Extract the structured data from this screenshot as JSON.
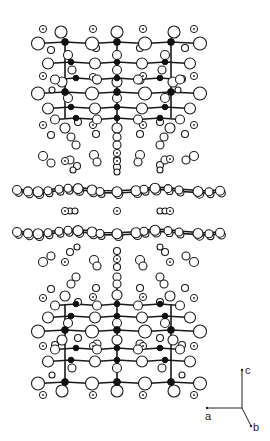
{
  "figure": {
    "colors": {
      "bond": "#1a1a1a",
      "metal": "#111111",
      "atom_fill": "#ffffff"
    }
  },
  "axes": {
    "labels": {
      "a": "a",
      "b": "b",
      "c": "c"
    },
    "origin": [
      242,
      408
    ],
    "a_end": [
      207,
      408
    ],
    "b_end": [
      251,
      426
    ],
    "c_end": [
      242,
      370
    ]
  },
  "upper_block": {
    "chains": [
      {
        "y": 42,
        "xs": [
          38,
          65,
          92,
          117,
          145,
          171,
          200
        ],
        "metal_idx": [
          1,
          3,
          5
        ],
        "r_open": 6.5
      },
      {
        "y": 62,
        "xs": [
          48,
          71,
          95,
          117,
          142,
          165,
          190
        ],
        "metal_idx": [
          1,
          3,
          5
        ],
        "r_open": 5.5
      },
      {
        "y": 78,
        "xs": [
          55,
          76,
          97,
          117,
          138,
          160,
          180
        ],
        "metal_idx": [
          1,
          3,
          5
        ],
        "r_open": 4.5
      },
      {
        "y": 92,
        "xs": [
          38,
          65,
          92,
          117,
          145,
          171,
          200
        ],
        "metal_idx": [
          1,
          3,
          5
        ],
        "r_open": 6.5
      },
      {
        "y": 107,
        "xs": [
          48,
          71,
          95,
          117,
          142,
          165,
          190
        ],
        "metal_idx": [
          1,
          3,
          5
        ],
        "r_open": 5.5
      },
      {
        "y": 118,
        "xs": [
          55,
          76,
          97,
          117,
          138,
          160,
          180
        ],
        "metal_idx": [
          1,
          3,
          5
        ],
        "r_open": 4.5
      }
    ],
    "verticals": [
      {
        "x": 65,
        "y1": 42,
        "y2": 118
      },
      {
        "x": 117,
        "y1": 30,
        "y2": 145
      },
      {
        "x": 171,
        "y1": 42,
        "y2": 118
      }
    ],
    "extra_open": [
      [
        61,
        32,
        6
      ],
      [
        117,
        32,
        6
      ],
      [
        174,
        32,
        6
      ],
      [
        51,
        50,
        3.5
      ],
      [
        96,
        48,
        3.5
      ],
      [
        140,
        48,
        3.5
      ],
      [
        185,
        48,
        3.5
      ],
      [
        68,
        55,
        4.5
      ],
      [
        117,
        55,
        4.5
      ],
      [
        165,
        55,
        4.5
      ],
      [
        72,
        70,
        4
      ],
      [
        117,
        70,
        4.5
      ],
      [
        162,
        70,
        4
      ],
      [
        55,
        79,
        3.5
      ],
      [
        97,
        80,
        4
      ],
      [
        140,
        80,
        4
      ],
      [
        182,
        79,
        3.5
      ],
      [
        62,
        82,
        5
      ],
      [
        117,
        82,
        5
      ],
      [
        173,
        82,
        5
      ],
      [
        52,
        90,
        3
      ],
      [
        178,
        90,
        3
      ],
      [
        68,
        98,
        4.5
      ],
      [
        117,
        98,
        4.5
      ],
      [
        165,
        98,
        4.5
      ],
      [
        78,
        122,
        3.5
      ],
      [
        160,
        122,
        3.5
      ],
      [
        65,
        128,
        5
      ],
      [
        170,
        128,
        5
      ],
      [
        117,
        128,
        5
      ],
      [
        51,
        135,
        3.5
      ],
      [
        96,
        134,
        3.5
      ],
      [
        140,
        134,
        3.5
      ],
      [
        185,
        134,
        3.5
      ],
      [
        71,
        137,
        4
      ],
      [
        117,
        137,
        4
      ],
      [
        164,
        137,
        4
      ],
      [
        76,
        145,
        4
      ],
      [
        117,
        145,
        4
      ],
      [
        160,
        145,
        4
      ]
    ],
    "dotted": [
      [
        43,
        29
      ],
      [
        93,
        29
      ],
      [
        143,
        29
      ],
      [
        194,
        29
      ],
      [
        43,
        76
      ],
      [
        93,
        77
      ],
      [
        143,
        76
      ],
      [
        194,
        76
      ],
      [
        43,
        125
      ],
      [
        93,
        125
      ],
      [
        143,
        125
      ],
      [
        194,
        125
      ]
    ]
  },
  "middle": {
    "upper_cluster_open": [
      [
        43,
        156,
        4.5
      ],
      [
        51,
        163,
        4
      ],
      [
        70,
        160,
        4
      ],
      [
        77,
        166,
        3.5
      ],
      [
        94,
        155,
        4.5
      ],
      [
        97,
        162,
        4
      ],
      [
        117,
        160,
        3.5
      ],
      [
        117,
        167,
        3.5
      ],
      [
        140,
        155,
        4.5
      ],
      [
        138,
        162,
        4
      ],
      [
        160,
        165,
        3.5
      ],
      [
        165,
        160,
        4
      ],
      [
        186,
        160,
        4
      ],
      [
        194,
        156,
        4.5
      ],
      [
        73,
        170,
        3
      ],
      [
        160,
        170,
        3
      ],
      [
        117,
        172,
        3
      ]
    ],
    "upper_cluster_dotted": [
      [
        65,
        161
      ],
      [
        117,
        153
      ],
      [
        117,
        161
      ],
      [
        170,
        159
      ]
    ],
    "sheet_1": {
      "y": 190,
      "xs": [
        17,
        28,
        38,
        48,
        59,
        68,
        78,
        92,
        100,
        117,
        136,
        144,
        155,
        168,
        179,
        198,
        209,
        220
      ],
      "rs": [
        4.5,
        4.5,
        5,
        4,
        4,
        4,
        5,
        5,
        4,
        5,
        5,
        4,
        5,
        4,
        4,
        5,
        4,
        4.5
      ]
    },
    "sheet_2": {
      "y": 232,
      "xs": [
        17,
        28,
        38,
        48,
        59,
        68,
        78,
        92,
        100,
        117,
        136,
        144,
        155,
        168,
        179,
        198,
        209,
        220
      ],
      "rs": [
        4.5,
        4.5,
        5,
        4,
        4,
        4,
        5,
        5,
        4,
        5,
        5,
        4,
        5,
        4,
        4,
        5,
        4,
        4.5
      ]
    },
    "between_dotted": [
      [
        65,
        211
      ],
      [
        117,
        211
      ],
      [
        170,
        211
      ]
    ],
    "between_open": [
      [
        70,
        211,
        3
      ],
      [
        75,
        211,
        3
      ],
      [
        160,
        211,
        3
      ],
      [
        165,
        211,
        3
      ]
    ],
    "lower_cluster_open": [
      [
        43,
        262,
        4.5
      ],
      [
        51,
        256,
        4
      ],
      [
        70,
        252,
        3.5
      ],
      [
        77,
        247,
        3
      ],
      [
        94,
        260,
        4.5
      ],
      [
        97,
        266,
        4
      ],
      [
        117,
        251,
        3.5
      ],
      [
        117,
        267,
        3.5
      ],
      [
        140,
        260,
        4.5
      ],
      [
        143,
        266,
        4
      ],
      [
        160,
        247,
        3
      ],
      [
        165,
        252,
        3.5
      ],
      [
        186,
        256,
        4
      ],
      [
        194,
        262,
        4.5
      ]
    ],
    "lower_cluster_dotted": [
      [
        65,
        262
      ],
      [
        117,
        259
      ],
      [
        170,
        262
      ]
    ]
  },
  "lower_block": {
    "chains": [
      {
        "y": 304,
        "xs": [
          55,
          76,
          97,
          117,
          138,
          160,
          180
        ],
        "metal_idx": [
          1,
          3,
          5
        ],
        "r_open": 4.5
      },
      {
        "y": 316,
        "xs": [
          48,
          71,
          95,
          117,
          142,
          165,
          190
        ],
        "metal_idx": [
          1,
          3,
          5
        ],
        "r_open": 5.5
      },
      {
        "y": 330,
        "xs": [
          38,
          65,
          92,
          117,
          145,
          171,
          200
        ],
        "metal_idx": [
          1,
          3,
          5
        ],
        "r_open": 6.5
      },
      {
        "y": 348,
        "xs": [
          55,
          76,
          97,
          117,
          138,
          160,
          180
        ],
        "metal_idx": [
          1,
          3,
          5
        ],
        "r_open": 4.5
      },
      {
        "y": 360,
        "xs": [
          48,
          71,
          95,
          117,
          142,
          165,
          190
        ],
        "metal_idx": [
          1,
          3,
          5
        ],
        "r_open": 5.5
      },
      {
        "y": 382,
        "xs": [
          38,
          65,
          92,
          117,
          145,
          171,
          200
        ],
        "metal_idx": [
          1,
          3,
          5
        ],
        "r_open": 6.5
      }
    ],
    "verticals": [
      {
        "x": 65,
        "y1": 304,
        "y2": 382
      },
      {
        "x": 117,
        "y1": 276,
        "y2": 392
      },
      {
        "x": 171,
        "y1": 304,
        "y2": 382
      }
    ],
    "extra_open": [
      [
        76,
        277,
        4
      ],
      [
        117,
        277,
        4
      ],
      [
        160,
        277,
        4
      ],
      [
        71,
        284,
        4
      ],
      [
        117,
        284,
        4
      ],
      [
        164,
        284,
        4
      ],
      [
        51,
        289,
        3.5
      ],
      [
        96,
        288,
        3.5
      ],
      [
        140,
        288,
        3.5
      ],
      [
        185,
        288,
        3.5
      ],
      [
        65,
        296,
        5
      ],
      [
        117,
        295,
        5
      ],
      [
        170,
        296,
        5
      ],
      [
        78,
        302,
        3.5
      ],
      [
        160,
        302,
        3.5
      ],
      [
        68,
        323,
        4.5
      ],
      [
        117,
        323,
        4.5
      ],
      [
        165,
        323,
        4.5
      ],
      [
        62,
        340,
        5
      ],
      [
        117,
        340,
        5
      ],
      [
        173,
        340,
        5
      ],
      [
        55,
        345,
        3.5
      ],
      [
        97,
        344,
        4
      ],
      [
        140,
        344,
        4
      ],
      [
        182,
        345,
        3.5
      ],
      [
        78,
        338,
        3.5
      ],
      [
        160,
        338,
        3.5
      ],
      [
        72,
        368,
        4
      ],
      [
        117,
        368,
        4.5
      ],
      [
        162,
        368,
        4
      ],
      [
        52,
        375,
        3
      ],
      [
        182,
        375,
        3
      ],
      [
        62,
        391,
        6
      ],
      [
        117,
        391,
        6
      ],
      [
        174,
        391,
        6
      ]
    ],
    "dotted": [
      [
        43,
        298
      ],
      [
        93,
        297
      ],
      [
        143,
        297
      ],
      [
        194,
        298
      ],
      [
        43,
        346
      ],
      [
        93,
        346
      ],
      [
        143,
        346
      ],
      [
        194,
        346
      ],
      [
        43,
        395
      ],
      [
        93,
        395
      ],
      [
        143,
        395
      ],
      [
        194,
        395
      ]
    ]
  }
}
